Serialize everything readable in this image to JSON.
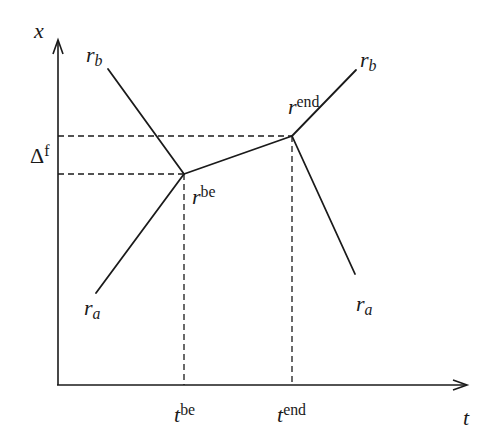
{
  "diagram": {
    "type": "piecewise-linear crossing diagram",
    "axes": {
      "x_axis_label": "t",
      "y_axis_label": "x"
    },
    "labels": {
      "rb_top_left": {
        "base": "r",
        "sub": "b"
      },
      "ra_bottom_left": {
        "base": "r",
        "sub": "a"
      },
      "rb_top_right": {
        "base": "r",
        "sub": "b"
      },
      "ra_bottom_right": {
        "base": "r",
        "sub": "a"
      },
      "r_be": {
        "base": "r",
        "sup": "be"
      },
      "r_end": {
        "base": "r",
        "sup": "end"
      },
      "t_be": {
        "base": "t",
        "sup": "be"
      },
      "t_end": {
        "base": "t",
        "sup": "end"
      },
      "delta_f": {
        "base": "Δ",
        "sup": "f"
      }
    },
    "points": {
      "origin": [
        58,
        385
      ],
      "r_be": [
        184,
        174
      ],
      "r_end": [
        292,
        136
      ],
      "rb_left_end": [
        108,
        69
      ],
      "ra_left_end": [
        96,
        293
      ],
      "rb_right_end": [
        356,
        70
      ],
      "ra_right_end": [
        355,
        274
      ]
    },
    "colors": {
      "line": "#1a1a1a",
      "background": "#ffffff"
    }
  }
}
